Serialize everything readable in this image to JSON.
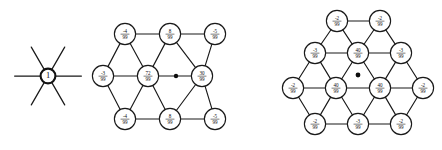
{
  "figure": {
    "caption": "",
    "background_color": "#ffffff",
    "ink_color": "#161616",
    "panels": [
      {
        "id": "panel-left",
        "name": "single-site-star",
        "center": [
          48,
          76
        ],
        "center_label": "1",
        "spoke_count": 6,
        "spoke_length": 26,
        "node_radius": 7.4,
        "nodes": [
          {
            "label": "1",
            "x": 48,
            "y": 76,
            "r": 7.4,
            "style": "heavy",
            "type": "integer"
          }
        ],
        "bonds": [],
        "center_dot": null
      },
      {
        "id": "panel-middle",
        "name": "triangular-lattice-72-99",
        "node_radius": 10.6,
        "center_dot": {
          "x": 176,
          "y": 76,
          "r": 2.2
        },
        "nodes": [
          {
            "id": "m-t1",
            "num": "-4",
            "den": "99",
            "x": 125,
            "y": 34,
            "r": 10.6,
            "style": "normal"
          },
          {
            "id": "m-t2",
            "num": "8",
            "den": "99",
            "x": 170,
            "y": 34,
            "r": 10.6,
            "style": "normal"
          },
          {
            "id": "m-t3",
            "num": "-5",
            "den": "99",
            "x": 215,
            "y": 34,
            "r": 10.6,
            "style": "normal"
          },
          {
            "id": "m-m1",
            "num": "-3",
            "den": "99",
            "x": 103,
            "y": 76,
            "r": 10.6,
            "style": "normal"
          },
          {
            "id": "m-m2",
            "num": "72",
            "den": "99",
            "x": 148,
            "y": 76,
            "r": 10.6,
            "style": "normal"
          },
          {
            "id": "m-m3",
            "num": "30",
            "den": "99",
            "x": 202,
            "y": 76,
            "r": 10.6,
            "style": "normal"
          },
          {
            "id": "m-b1",
            "num": "-4",
            "den": "99",
            "x": 125,
            "y": 119,
            "r": 10.6,
            "style": "normal"
          },
          {
            "id": "m-b2",
            "num": "8",
            "den": "99",
            "x": 170,
            "y": 119,
            "r": 10.6,
            "style": "normal"
          },
          {
            "id": "m-b3",
            "num": "-5",
            "den": "99",
            "x": 215,
            "y": 119,
            "r": 10.6,
            "style": "normal"
          }
        ],
        "bonds": [
          [
            "m-t1",
            "m-t2"
          ],
          [
            "m-t2",
            "m-t3"
          ],
          [
            "m-m1",
            "m-m2"
          ],
          [
            "m-m2",
            "m-m3"
          ],
          [
            "m-b1",
            "m-b2"
          ],
          [
            "m-b2",
            "m-b3"
          ],
          [
            "m-t1",
            "m-m1"
          ],
          [
            "m-t1",
            "m-m2"
          ],
          [
            "m-t2",
            "m-m2"
          ],
          [
            "m-t2",
            "m-m3"
          ],
          [
            "m-t3",
            "m-m3"
          ],
          [
            "m-m1",
            "m-b1"
          ],
          [
            "m-m2",
            "m-b1"
          ],
          [
            "m-m2",
            "m-b2"
          ],
          [
            "m-m3",
            "m-b2"
          ],
          [
            "m-m3",
            "m-b3"
          ]
        ]
      },
      {
        "id": "panel-right",
        "name": "hexagonal-lattice-40-99",
        "node_radius": 10.6,
        "center_dot": {
          "x": 358,
          "y": 75,
          "r": 2.4
        },
        "nodes": [
          {
            "id": "r-a1",
            "num": "-2",
            "den": "99",
            "x": 337,
            "y": 21,
            "r": 10.6,
            "style": "normal"
          },
          {
            "id": "r-a2",
            "num": "-2",
            "den": "99",
            "x": 380,
            "y": 21,
            "r": 10.6,
            "style": "normal"
          },
          {
            "id": "r-b1",
            "num": "-3",
            "den": "99",
            "x": 315,
            "y": 53,
            "r": 10.6,
            "style": "normal"
          },
          {
            "id": "r-b2",
            "num": "40",
            "den": "99",
            "x": 358,
            "y": 53,
            "r": 10.6,
            "style": "normal"
          },
          {
            "id": "r-b3",
            "num": "-3",
            "den": "99",
            "x": 401,
            "y": 53,
            "r": 10.6,
            "style": "normal"
          },
          {
            "id": "r-c1",
            "num": "-2",
            "den": "99",
            "x": 293,
            "y": 88,
            "r": 10.6,
            "style": "normal"
          },
          {
            "id": "r-c2",
            "num": "40",
            "den": "99",
            "x": 336,
            "y": 88,
            "r": 10.6,
            "style": "normal"
          },
          {
            "id": "r-c3",
            "num": "40",
            "den": "99",
            "x": 380,
            "y": 88,
            "r": 10.6,
            "style": "normal"
          },
          {
            "id": "r-c4",
            "num": "-2",
            "den": "99",
            "x": 423,
            "y": 88,
            "r": 10.6,
            "style": "normal"
          },
          {
            "id": "r-d1",
            "num": "-2",
            "den": "99",
            "x": 315,
            "y": 124,
            "r": 10.6,
            "style": "normal"
          },
          {
            "id": "r-d2",
            "num": "-3",
            "den": "99",
            "x": 358,
            "y": 124,
            "r": 10.6,
            "style": "normal"
          },
          {
            "id": "r-d3",
            "num": "-2",
            "den": "99",
            "x": 401,
            "y": 124,
            "r": 10.6,
            "style": "normal"
          }
        ],
        "bonds": [
          [
            "r-a1",
            "r-a2"
          ],
          [
            "r-b1",
            "r-b2"
          ],
          [
            "r-b2",
            "r-b3"
          ],
          [
            "r-c1",
            "r-c2"
          ],
          [
            "r-c2",
            "r-c3"
          ],
          [
            "r-c3",
            "r-c4"
          ],
          [
            "r-d1",
            "r-d2"
          ],
          [
            "r-d2",
            "r-d3"
          ],
          [
            "r-a1",
            "r-b1"
          ],
          [
            "r-a1",
            "r-b2"
          ],
          [
            "r-a2",
            "r-b2"
          ],
          [
            "r-a2",
            "r-b3"
          ],
          [
            "r-b1",
            "r-c1"
          ],
          [
            "r-b1",
            "r-c2"
          ],
          [
            "r-b2",
            "r-c2"
          ],
          [
            "r-b2",
            "r-c3"
          ],
          [
            "r-b3",
            "r-c3"
          ],
          [
            "r-b3",
            "r-c4"
          ],
          [
            "r-c1",
            "r-d1"
          ],
          [
            "r-c2",
            "r-d1"
          ],
          [
            "r-c2",
            "r-d2"
          ],
          [
            "r-c3",
            "r-d2"
          ],
          [
            "r-c3",
            "r-d3"
          ],
          [
            "r-c4",
            "r-d3"
          ]
        ]
      }
    ]
  }
}
